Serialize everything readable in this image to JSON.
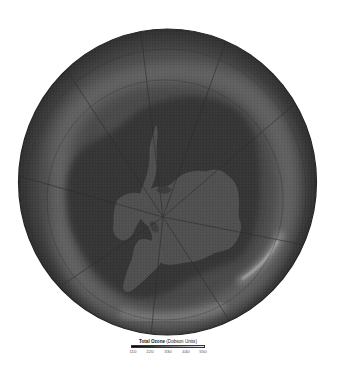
{
  "map": {
    "type": "polar-stereographic",
    "region": "Antarctica / Southern Hemisphere",
    "variable": "Total Ozone",
    "features": {
      "continent": "Antarctica",
      "ozone_hole": "dark region centered over Antarctica",
      "high_ozone_ring": "lighter band surrounding the hole, brightest lower-right and bottom"
    },
    "colors": {
      "background": "#ffffff",
      "globe_outer": "#4b4b4b",
      "ozone_hole": "#383838",
      "continent": "#505050",
      "high_ozone_ring": "#6e6e6e",
      "grid_lines": "#2e2e2e"
    }
  },
  "legend": {
    "title": "Total Ozone",
    "units": "(Dobson Units)",
    "ticks": [
      "110",
      "220",
      "330",
      "440",
      "550"
    ],
    "min": 110,
    "max": 550,
    "colormap": "grayscale dark-to-light"
  }
}
